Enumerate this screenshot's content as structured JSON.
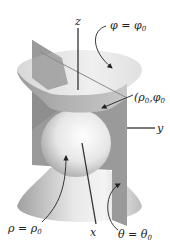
{
  "figure": {
    "axes": {
      "z": "z",
      "y": "y",
      "x": "x"
    },
    "labels": {
      "cone": {
        "var": "φ",
        "eq": " = ",
        "val": "φ",
        "sub": "0"
      },
      "point": {
        "open": "(",
        "v1": "ρ",
        "s1": "0",
        "comma": ",",
        "v2": "φ",
        "s2": "0"
      },
      "sphere": {
        "var": "ρ",
        "eq": " = ",
        "val": "ρ",
        "sub": "0"
      },
      "plane": {
        "var": "θ",
        "eq": " = ",
        "val": "θ",
        "sub": "0"
      }
    },
    "colors": {
      "cone_outer": "#a9a9a9",
      "cone_inner": "#e4e4e4",
      "plane": "#9a9a9a",
      "sphere_light": "#ffffff",
      "sphere_dark": "#9e9e9e",
      "axis": "#333333"
    }
  }
}
